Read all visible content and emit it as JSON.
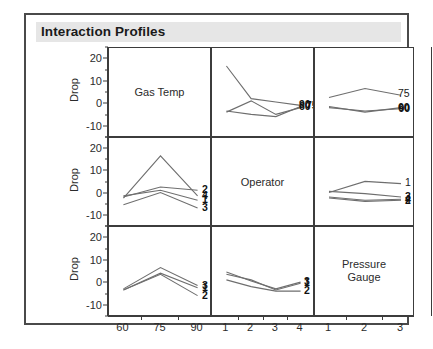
{
  "title": "Interaction Profiles",
  "axes": {
    "y_title": "Drop",
    "y_ticks": [
      "20",
      "10",
      "0",
      "-10"
    ],
    "y_values": [
      20,
      10,
      0,
      -10
    ],
    "y_limits": [
      -15,
      25
    ],
    "x_columns": [
      {
        "name": "Gas Temp",
        "ticks": [
          "60",
          "75",
          "90"
        ]
      },
      {
        "name": "Operator",
        "ticks": [
          "1",
          "2",
          "3",
          "4"
        ]
      },
      {
        "name": "Pressure Gauge",
        "ticks": [
          "1",
          "2",
          "3"
        ]
      }
    ],
    "row_labels": [
      "Gas Temp",
      "Operator",
      "ressure Gaug"
    ]
  },
  "diagonal_cells": {
    "r0c0": "Gas Temp",
    "r1c1": "Operator",
    "r2c2_line1": "Pressure",
    "r2c2_line2": "Gauge"
  },
  "chart_data": {
    "type": "line",
    "title": "Interaction Profiles",
    "ylabel": "Drop",
    "ylim": [
      -15,
      25
    ],
    "grid": false,
    "legend": "series labels at right end of each line",
    "layout": "3x3 interaction profile matrix; diagonal cells contain factor names",
    "factors": [
      {
        "name": "Gas Temp",
        "levels": [
          "60",
          "75",
          "90"
        ]
      },
      {
        "name": "Operator",
        "levels": [
          "1",
          "2",
          "3",
          "4"
        ]
      },
      {
        "name": "Pressure Gauge",
        "levels": [
          "1",
          "2",
          "3"
        ]
      }
    ],
    "panels": [
      {
        "row": 0,
        "col": 0,
        "kind": "diagonal",
        "label": "Gas Temp"
      },
      {
        "row": 0,
        "col": 1,
        "kind": "interaction",
        "x_factor": "Operator",
        "trace_factor": "Gas Temp",
        "x": [
          1,
          2,
          3,
          4
        ],
        "series": [
          {
            "name": "60",
            "values": [
              -3.0,
              -4.5,
              -5.5,
              -1.0
            ]
          },
          {
            "name": "75",
            "values": [
              -3.5,
              1.5,
              -4.5,
              -1.5
            ]
          },
          {
            "name": "90",
            "values": [
              17.0,
              2.5,
              1.0,
              -0.5
            ]
          }
        ]
      },
      {
        "row": 0,
        "col": 2,
        "kind": "interaction",
        "x_factor": "Pressure Gauge",
        "trace_factor": "Gas Temp",
        "x": [
          1,
          2,
          3
        ],
        "series": [
          {
            "name": "75",
            "values": [
              3.0,
              7.0,
              4.0
            ]
          },
          {
            "name": "60",
            "values": [
              -1.0,
              -3.5,
              -1.5
            ]
          },
          {
            "name": "90",
            "values": [
              -1.5,
              -3.0,
              -2.0
            ]
          }
        ]
      },
      {
        "row": 1,
        "col": 0,
        "kind": "interaction",
        "x_factor": "Gas Temp",
        "trace_factor": "Operator",
        "x": [
          60,
          75,
          90
        ],
        "series": [
          {
            "name": "2",
            "values": [
              -1.5,
              3.0,
              1.5
            ]
          },
          {
            "name": "4",
            "values": [
              -2.0,
              17.0,
              -1.0
            ]
          },
          {
            "name": "1",
            "values": [
              -1.0,
              1.5,
              -3.0
            ]
          },
          {
            "name": "3",
            "values": [
              -5.0,
              0.5,
              -6.5
            ]
          }
        ]
      },
      {
        "row": 1,
        "col": 1,
        "kind": "diagonal",
        "label": "Operator"
      },
      {
        "row": 1,
        "col": 2,
        "kind": "interaction",
        "x_factor": "Pressure Gauge",
        "trace_factor": "Operator",
        "x": [
          1,
          2,
          3
        ],
        "series": [
          {
            "name": "1",
            "values": [
              0.5,
              5.5,
              4.5
            ]
          },
          {
            "name": "3",
            "values": [
              1.0,
              0.0,
              -1.5
            ]
          },
          {
            "name": "4",
            "values": [
              -1.5,
              -3.0,
              -2.5
            ]
          },
          {
            "name": "2",
            "values": [
              -2.0,
              -3.5,
              -3.0
            ]
          }
        ]
      },
      {
        "row": 2,
        "col": 0,
        "kind": "interaction",
        "x_factor": "Gas Temp",
        "trace_factor": "Pressure Gauge",
        "x": [
          60,
          75,
          90
        ],
        "series": [
          {
            "name": "3",
            "values": [
              -2.5,
              7.0,
              -1.0
            ]
          },
          {
            "name": "1",
            "values": [
              -3.0,
              4.5,
              -2.0
            ]
          },
          {
            "name": "2",
            "values": [
              -3.0,
              4.0,
              -5.5
            ]
          }
        ]
      },
      {
        "row": 2,
        "col": 1,
        "kind": "interaction",
        "x_factor": "Operator",
        "trace_factor": "Pressure Gauge",
        "x": [
          1,
          2,
          3,
          4
        ],
        "series": [
          {
            "name": "3",
            "values": [
              5.0,
              1.0,
              -2.5,
              0.5
            ]
          },
          {
            "name": "1",
            "values": [
              4.0,
              1.5,
              -3.0,
              0.0
            ]
          },
          {
            "name": "2",
            "values": [
              1.5,
              -1.5,
              -3.5,
              -3.5
            ]
          }
        ]
      },
      {
        "row": 2,
        "col": 2,
        "kind": "diagonal",
        "label": "Pressure Gauge"
      }
    ]
  },
  "endlabels": {
    "r0c1": [
      "90",
      "75",
      "60"
    ],
    "r0c2_top": "75",
    "r0c2_stack": [
      "60",
      "90"
    ],
    "r1c0": [
      "2",
      "4",
      "1",
      "3"
    ],
    "r1c2_top": "1",
    "r1c2_stack": [
      "3",
      "4",
      "2"
    ],
    "r2c0": [
      "3",
      "1",
      "2"
    ],
    "r2c1": [
      "3",
      "1",
      "2"
    ]
  },
  "colors": {
    "frame": "#4a4a4a",
    "title_band": "#e6e6e6",
    "title_text": "#1a1a1a",
    "cell_border": "#3c3c3c",
    "line": "#6e6e6e",
    "axis_text": "#2b2b2b",
    "background": "#ffffff"
  }
}
